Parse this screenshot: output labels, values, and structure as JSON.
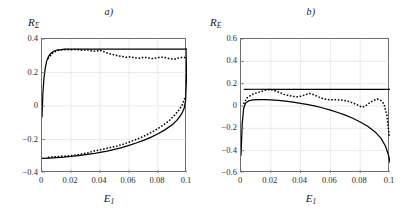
{
  "figure": {
    "background": "#ffffff",
    "axis_color": "#6d6d6d",
    "curve_color": "#000000",
    "grid_color": "#dcdcdc"
  },
  "panels": [
    {
      "id": "a",
      "title": "a)",
      "ylabel_base": "R",
      "ylabel_sub": "Σ",
      "xlabel_base": "E",
      "xlabel_sub": "1",
      "yticks": [
        "0.4",
        "0.2",
        "0",
        "−0.2",
        "−0.4"
      ],
      "ytick_values": [
        0.4,
        0.2,
        0,
        -0.2,
        -0.4
      ],
      "xticks": [
        "0",
        "0.02",
        "0.04",
        "0.06",
        "0.08",
        "0.1"
      ],
      "xtick_values": [
        0,
        0.02,
        0.04,
        0.06,
        0.08,
        0.1
      ]
    },
    {
      "id": "b",
      "title": "b)",
      "ylabel_base": "R",
      "ylabel_sub": "E",
      "xlabel_base": "E",
      "xlabel_sub": "1",
      "yticks": [
        "0.6",
        "0.4",
        "0.2",
        "0",
        "−0.2",
        "−0.4",
        "−0.6"
      ],
      "ytick_values": [
        0.6,
        0.4,
        0.2,
        0,
        -0.2,
        -0.4,
        -0.6
      ],
      "xticks": [
        "0",
        "0.02",
        "0.04",
        "0.06",
        "0.08",
        "0.1"
      ],
      "xtick_values": [
        0,
        0.02,
        0.04,
        0.06,
        0.08,
        0.1
      ]
    }
  ],
  "chart_data": [
    {
      "type": "line",
      "panel": "a",
      "title": "a)",
      "xlabel": "E_1",
      "ylabel": "R_Sigma",
      "xlim": [
        0,
        0.1
      ],
      "ylim": [
        -0.4,
        0.4
      ],
      "grid": true,
      "legend": "none",
      "series": [
        {
          "name": "upper-branch-solid",
          "style": "solid",
          "x": [
            0.0,
            0.0006,
            0.0013,
            0.0022,
            0.0032,
            0.0045,
            0.006,
            0.008,
            0.01,
            0.013,
            0.016,
            0.02,
            0.025,
            0.03,
            0.04,
            0.05,
            0.06,
            0.07,
            0.08,
            0.09,
            0.095,
            0.1
          ],
          "y": [
            -0.065,
            0.075,
            0.16,
            0.225,
            0.268,
            0.296,
            0.314,
            0.327,
            0.333,
            0.337,
            0.339,
            0.34,
            0.34,
            0.34,
            0.34,
            0.34,
            0.34,
            0.34,
            0.34,
            0.34,
            0.34,
            0.34
          ]
        },
        {
          "name": "upper-branch-dotted",
          "style": "dotted",
          "x": [
            0.004,
            0.008,
            0.012,
            0.016,
            0.02,
            0.024,
            0.028,
            0.031,
            0.034,
            0.037,
            0.04,
            0.043,
            0.046,
            0.049,
            0.052,
            0.055,
            0.058,
            0.061,
            0.064,
            0.067,
            0.07,
            0.073,
            0.076,
            0.079,
            0.082,
            0.085,
            0.088,
            0.091,
            0.094,
            0.097,
            0.1
          ],
          "y": [
            0.282,
            0.322,
            0.334,
            0.337,
            0.336,
            0.338,
            0.333,
            0.336,
            0.33,
            0.327,
            0.333,
            0.323,
            0.313,
            0.307,
            0.3,
            0.296,
            0.291,
            0.294,
            0.287,
            0.285,
            0.291,
            0.288,
            0.283,
            0.287,
            0.292,
            0.289,
            0.283,
            0.279,
            0.286,
            0.291,
            0.288
          ]
        },
        {
          "name": "lower-branch-solid",
          "style": "solid",
          "x": [
            0.0,
            0.005,
            0.01,
            0.015,
            0.02,
            0.025,
            0.03,
            0.035,
            0.04,
            0.045,
            0.05,
            0.055,
            0.06,
            0.065,
            0.07,
            0.075,
            0.08,
            0.085,
            0.09,
            0.093,
            0.096,
            0.098,
            0.099,
            0.0995,
            0.1
          ],
          "y": [
            -0.313,
            -0.311,
            -0.308,
            -0.305,
            -0.301,
            -0.296,
            -0.291,
            -0.285,
            -0.277,
            -0.269,
            -0.259,
            -0.248,
            -0.235,
            -0.221,
            -0.205,
            -0.187,
            -0.166,
            -0.141,
            -0.11,
            -0.086,
            -0.052,
            -0.015,
            0.03,
            0.13,
            0.34
          ]
        },
        {
          "name": "lower-branch-dotted",
          "style": "dotted",
          "x": [
            0.004,
            0.008,
            0.012,
            0.016,
            0.02,
            0.024,
            0.028,
            0.032,
            0.036,
            0.04,
            0.044,
            0.048,
            0.052,
            0.056,
            0.06,
            0.064,
            0.068,
            0.072,
            0.076,
            0.08,
            0.084,
            0.088,
            0.092,
            0.095,
            0.097,
            0.099
          ],
          "y": [
            -0.306,
            -0.304,
            -0.301,
            -0.299,
            -0.296,
            -0.291,
            -0.286,
            -0.279,
            -0.268,
            -0.262,
            -0.254,
            -0.246,
            -0.238,
            -0.228,
            -0.216,
            -0.203,
            -0.189,
            -0.173,
            -0.155,
            -0.135,
            -0.112,
            -0.085,
            -0.05,
            -0.018,
            0.012,
            0.06
          ]
        }
      ]
    },
    {
      "type": "line",
      "panel": "b",
      "title": "b)",
      "xlabel": "E_1",
      "ylabel": "R_E",
      "xlim": [
        0,
        0.1
      ],
      "ylim": [
        -0.6,
        0.6
      ],
      "grid": true,
      "legend": "none",
      "series": [
        {
          "name": "flat-solid-line",
          "style": "solid",
          "x": [
            0.0022,
            0.01,
            0.02,
            0.03,
            0.04,
            0.05,
            0.06,
            0.07,
            0.08,
            0.09,
            0.1
          ],
          "y": [
            0.148,
            0.15,
            0.15,
            0.15,
            0.15,
            0.15,
            0.15,
            0.15,
            0.15,
            0.15,
            0.15
          ]
        },
        {
          "name": "arc-solid-curve",
          "style": "solid",
          "x": [
            0.0,
            0.0008,
            0.0018,
            0.003,
            0.005,
            0.008,
            0.012,
            0.016,
            0.02,
            0.025,
            0.03,
            0.035,
            0.04,
            0.045,
            0.05,
            0.055,
            0.06,
            0.065,
            0.07,
            0.075,
            0.08,
            0.085,
            0.09,
            0.094,
            0.097,
            0.099,
            0.1
          ],
          "y": [
            -0.44,
            -0.16,
            -0.02,
            0.025,
            0.045,
            0.055,
            0.058,
            0.058,
            0.055,
            0.05,
            0.043,
            0.034,
            0.024,
            0.012,
            -0.002,
            -0.018,
            -0.037,
            -0.058,
            -0.082,
            -0.11,
            -0.143,
            -0.182,
            -0.232,
            -0.29,
            -0.36,
            -0.44,
            -0.505
          ]
        },
        {
          "name": "oscillating-dotted-curve",
          "style": "dotted",
          "x": [
            0.0016,
            0.004,
            0.007,
            0.01,
            0.013,
            0.016,
            0.019,
            0.021,
            0.023,
            0.026,
            0.029,
            0.032,
            0.035,
            0.038,
            0.041,
            0.0435,
            0.046,
            0.049,
            0.052,
            0.055,
            0.058,
            0.061,
            0.064,
            0.067,
            0.07,
            0.073,
            0.076,
            0.079,
            0.0815,
            0.084,
            0.0865,
            0.089,
            0.0915,
            0.094,
            0.096,
            0.098,
            0.0995
          ],
          "y": [
            0.018,
            0.072,
            0.1,
            0.115,
            0.128,
            0.14,
            0.148,
            0.144,
            0.136,
            0.12,
            0.104,
            0.093,
            0.086,
            0.082,
            0.09,
            0.102,
            0.112,
            0.1,
            0.082,
            0.066,
            0.058,
            0.055,
            0.056,
            0.054,
            0.048,
            0.038,
            0.022,
            0.004,
            -0.012,
            0.005,
            0.03,
            0.05,
            0.062,
            0.05,
            0.018,
            -0.09,
            -0.272
          ]
        }
      ]
    }
  ]
}
